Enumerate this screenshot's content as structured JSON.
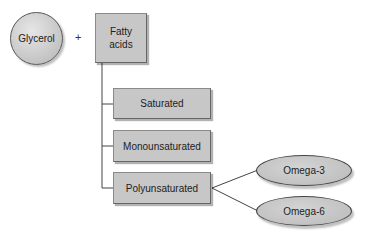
{
  "diagram": {
    "glycerol": {
      "label": "Glycerol"
    },
    "operator": "+",
    "fatty_acids": {
      "label": "Fatty\nacids",
      "line1": "Fatty",
      "line2": "acids"
    },
    "categories": [
      {
        "label": "Saturated"
      },
      {
        "label": "Monounsaturated"
      },
      {
        "label": "Polyunsaturated"
      }
    ],
    "polyunsaturated_subtypes": [
      {
        "label": "Omega-3"
      },
      {
        "label": "Omega-6"
      }
    ],
    "colors": {
      "node_fill": "#c7c7c7",
      "stroke": "#555555",
      "text": "#222222",
      "background": "#ffffff"
    }
  }
}
